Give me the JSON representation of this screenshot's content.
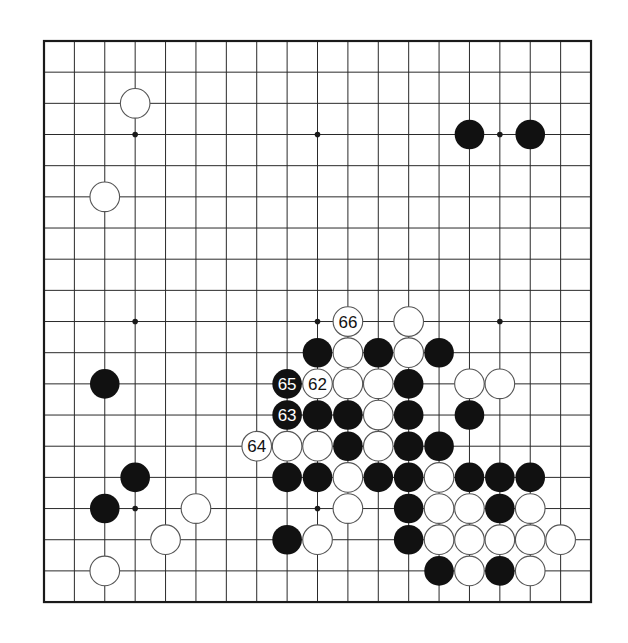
{
  "board": {
    "size": 19,
    "origin_x": 44,
    "origin_y": 41,
    "spacing_x": 30.39,
    "spacing_y": 31.17,
    "stone_radius": 14.8,
    "colors": {
      "line": "#2a2a2a",
      "border": "#1a1a1a",
      "black_stone": "#111111",
      "white_stone": "#ffffff",
      "white_stone_outline": "#555555",
      "black_label": "#ffffff",
      "white_label": "#111111"
    },
    "star_points": [
      [
        3,
        3
      ],
      [
        9,
        3
      ],
      [
        15,
        3
      ],
      [
        3,
        9
      ],
      [
        9,
        9
      ],
      [
        15,
        9
      ],
      [
        3,
        15
      ],
      [
        9,
        15
      ],
      [
        15,
        15
      ]
    ],
    "stones": [
      {
        "col": 3,
        "row": 2,
        "color": "white"
      },
      {
        "col": 14,
        "row": 3,
        "color": "black"
      },
      {
        "col": 16,
        "row": 3,
        "color": "black"
      },
      {
        "col": 2,
        "row": 5,
        "color": "white"
      },
      {
        "col": 10,
        "row": 9,
        "color": "white",
        "label": "66"
      },
      {
        "col": 12,
        "row": 9,
        "color": "white"
      },
      {
        "col": 9,
        "row": 10,
        "color": "black"
      },
      {
        "col": 10,
        "row": 10,
        "color": "white"
      },
      {
        "col": 11,
        "row": 10,
        "color": "black"
      },
      {
        "col": 12,
        "row": 10,
        "color": "white"
      },
      {
        "col": 13,
        "row": 10,
        "color": "black"
      },
      {
        "col": 2,
        "row": 11,
        "color": "black"
      },
      {
        "col": 8,
        "row": 11,
        "color": "black",
        "label": "65"
      },
      {
        "col": 9,
        "row": 11,
        "color": "white",
        "label": "62"
      },
      {
        "col": 10,
        "row": 11,
        "color": "white"
      },
      {
        "col": 11,
        "row": 11,
        "color": "white"
      },
      {
        "col": 12,
        "row": 11,
        "color": "black"
      },
      {
        "col": 14,
        "row": 11,
        "color": "white"
      },
      {
        "col": 15,
        "row": 11,
        "color": "white"
      },
      {
        "col": 8,
        "row": 12,
        "color": "black",
        "label": "63"
      },
      {
        "col": 9,
        "row": 12,
        "color": "black"
      },
      {
        "col": 10,
        "row": 12,
        "color": "black"
      },
      {
        "col": 11,
        "row": 12,
        "color": "white"
      },
      {
        "col": 12,
        "row": 12,
        "color": "black"
      },
      {
        "col": 14,
        "row": 12,
        "color": "black"
      },
      {
        "col": 7,
        "row": 13,
        "color": "white",
        "label": "64"
      },
      {
        "col": 8,
        "row": 13,
        "color": "white"
      },
      {
        "col": 9,
        "row": 13,
        "color": "white"
      },
      {
        "col": 10,
        "row": 13,
        "color": "black"
      },
      {
        "col": 11,
        "row": 13,
        "color": "white"
      },
      {
        "col": 12,
        "row": 13,
        "color": "black"
      },
      {
        "col": 13,
        "row": 13,
        "color": "black"
      },
      {
        "col": 3,
        "row": 14,
        "color": "black"
      },
      {
        "col": 8,
        "row": 14,
        "color": "black"
      },
      {
        "col": 9,
        "row": 14,
        "color": "black"
      },
      {
        "col": 10,
        "row": 14,
        "color": "white"
      },
      {
        "col": 11,
        "row": 14,
        "color": "black"
      },
      {
        "col": 12,
        "row": 14,
        "color": "black"
      },
      {
        "col": 13,
        "row": 14,
        "color": "white"
      },
      {
        "col": 14,
        "row": 14,
        "color": "black"
      },
      {
        "col": 15,
        "row": 14,
        "color": "black"
      },
      {
        "col": 16,
        "row": 14,
        "color": "black"
      },
      {
        "col": 2,
        "row": 15,
        "color": "black"
      },
      {
        "col": 5,
        "row": 15,
        "color": "white"
      },
      {
        "col": 10,
        "row": 15,
        "color": "white"
      },
      {
        "col": 12,
        "row": 15,
        "color": "black"
      },
      {
        "col": 13,
        "row": 15,
        "color": "white"
      },
      {
        "col": 14,
        "row": 15,
        "color": "white"
      },
      {
        "col": 15,
        "row": 15,
        "color": "black"
      },
      {
        "col": 16,
        "row": 15,
        "color": "white"
      },
      {
        "col": 4,
        "row": 16,
        "color": "white"
      },
      {
        "col": 8,
        "row": 16,
        "color": "black"
      },
      {
        "col": 9,
        "row": 16,
        "color": "white"
      },
      {
        "col": 12,
        "row": 16,
        "color": "black"
      },
      {
        "col": 13,
        "row": 16,
        "color": "white"
      },
      {
        "col": 14,
        "row": 16,
        "color": "white"
      },
      {
        "col": 15,
        "row": 16,
        "color": "white"
      },
      {
        "col": 16,
        "row": 16,
        "color": "white"
      },
      {
        "col": 17,
        "row": 16,
        "color": "white"
      },
      {
        "col": 2,
        "row": 17,
        "color": "white"
      },
      {
        "col": 13,
        "row": 17,
        "color": "black"
      },
      {
        "col": 14,
        "row": 17,
        "color": "white"
      },
      {
        "col": 15,
        "row": 17,
        "color": "black"
      },
      {
        "col": 16,
        "row": 17,
        "color": "white"
      }
    ]
  }
}
